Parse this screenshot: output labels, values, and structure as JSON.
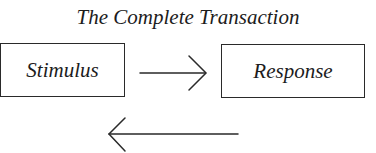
{
  "diagram": {
    "title": "The Complete Transaction",
    "nodes": [
      {
        "id": "stimulus",
        "label": "Stimulus"
      },
      {
        "id": "response",
        "label": "Response"
      }
    ],
    "edges": [
      {
        "from": "stimulus",
        "to": "response",
        "direction": "right",
        "label": ""
      },
      {
        "from": "response",
        "to": "stimulus",
        "direction": "left",
        "label": ""
      }
    ],
    "colors": {
      "stroke": "#2a2a2a",
      "text": "#1c1c1c",
      "background": "#ffffff"
    }
  }
}
